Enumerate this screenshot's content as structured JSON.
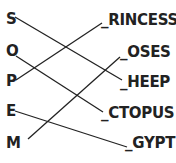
{
  "diagram": {
    "type": "matching-lines",
    "left_letters": [
      "S",
      "O",
      "P",
      "E",
      "M"
    ],
    "right_words": [
      "_RINCESS",
      "_OSES",
      "_HEEP",
      "_CTOPUS",
      "_GYPT"
    ],
    "connections": [
      {
        "from": "S",
        "to": "_HEEP"
      },
      {
        "from": "O",
        "to": "_CTOPUS"
      },
      {
        "from": "P",
        "to": "_RINCESS"
      },
      {
        "from": "E",
        "to": "_GYPT"
      },
      {
        "from": "M",
        "to": "_OSES"
      }
    ],
    "line_color": "#222222",
    "text_color": "#222222"
  }
}
